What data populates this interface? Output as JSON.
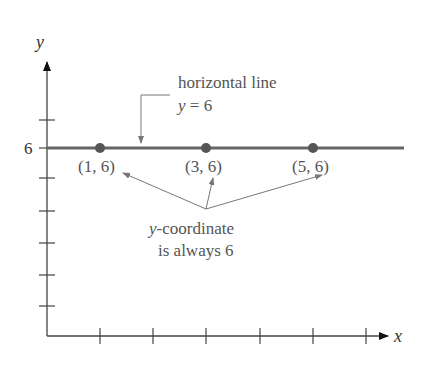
{
  "diagram": {
    "axes": {
      "x_label": "x",
      "y_label": "y",
      "y_tick_label": "6"
    },
    "line": {
      "label_line1": "horizontal line",
      "label_line2_var": "y",
      "label_line2_rest": " = 6",
      "color": "#666666"
    },
    "points": [
      {
        "label": "(1, 6)",
        "x": 1,
        "y": 6
      },
      {
        "label": "(3, 6)",
        "x": 3,
        "y": 6
      },
      {
        "label": "(5, 6)",
        "x": 5,
        "y": 6
      }
    ],
    "annotation": {
      "line1_var": "y",
      "line1_rest": "-coordinate",
      "line2": "is always 6"
    },
    "point_color": "#555555"
  }
}
